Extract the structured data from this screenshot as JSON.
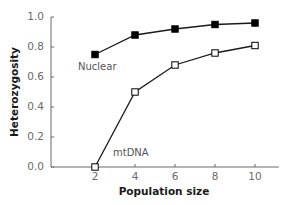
{
  "chart_data": {
    "type": "line",
    "title": "",
    "xlabel": "Population size",
    "ylabel": "Heterozygosity",
    "x": [
      2,
      4,
      6,
      8,
      10
    ],
    "xticks": [
      "2",
      "4",
      "6",
      "8",
      "10"
    ],
    "yticks": [
      "0.0",
      "0.2",
      "0.4",
      "0.6",
      "0.8",
      "1.0"
    ],
    "xlim": [
      0,
      11.5
    ],
    "ylim": [
      0,
      1.0
    ],
    "grid": false,
    "legend": "inline labels",
    "series": [
      {
        "name": "Nuclear",
        "marker": "filled-square",
        "color": "#000000",
        "values": [
          0.75,
          0.88,
          0.92,
          0.95,
          0.96
        ]
      },
      {
        "name": "mtDNA",
        "marker": "open-square",
        "color": "#000000",
        "values": [
          0.0,
          0.5,
          0.68,
          0.76,
          0.81
        ]
      }
    ],
    "annotations": [
      {
        "text": "Nuclear",
        "near_series": "Nuclear",
        "x": 2.3,
        "y": 0.68
      },
      {
        "text": "mtDNA",
        "near_series": "mtDNA",
        "x": 5.1,
        "y": 0.1
      }
    ]
  }
}
